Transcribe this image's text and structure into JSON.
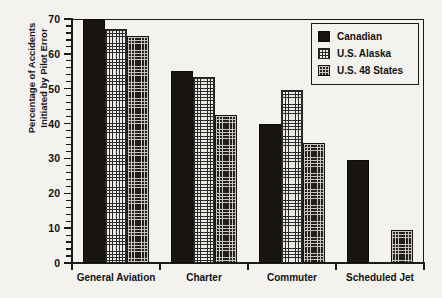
{
  "chart_data": {
    "type": "bar",
    "title": "",
    "subtitle": "",
    "xlabel": "",
    "ylabel": "Percentage of Accidents Initiated by Pilot Error",
    "ylabel_lines": [
      "Percentage of Accidents",
      "Initiated by Pilot Error"
    ],
    "categories": [
      "General Aviation",
      "Charter",
      "Commuter",
      "Scheduled Jet"
    ],
    "series": [
      {
        "name": "Canadian",
        "values": [
          70,
          55,
          40,
          29.5
        ],
        "pattern": "solid-black",
        "color": "#181410"
      },
      {
        "name": "U.S. Alaska",
        "values": [
          67,
          53.5,
          49.5,
          null
        ],
        "pattern": "light-grid",
        "color": "#eceae5"
      },
      {
        "name": "U.S. 48 States",
        "values": [
          65,
          42.5,
          34.5,
          9.5
        ],
        "pattern": "dark-grid",
        "color": "#221f1c"
      }
    ],
    "ylim": [
      0,
      70
    ],
    "y_major_ticks": [
      0,
      10,
      20,
      30,
      40,
      50,
      60,
      70
    ],
    "y_tick_labels": [
      "0",
      "10",
      "20",
      "30",
      "40",
      "50",
      "60",
      "70"
    ],
    "y_minor_tick_step": 2,
    "grid": false,
    "legend_position": "top-right",
    "background_color": "#f4f2ee",
    "ink_color": "#1a1a1a"
  }
}
